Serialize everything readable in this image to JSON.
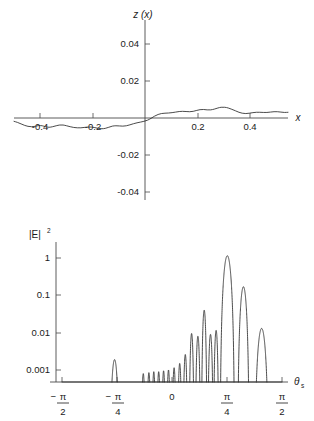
{
  "figure": {
    "background": "#ffffff",
    "line_color": "#2b2b2b",
    "axis_color": "#4a4a4a"
  },
  "chart_data": [
    {
      "id": "surface-profile",
      "type": "line",
      "title": "",
      "ylabel": "z (x)",
      "xlabel": "x",
      "xlim": [
        -0.5,
        0.5
      ],
      "ylim": [
        -0.05,
        0.05
      ],
      "grid": false,
      "legend": null,
      "xticks": [
        -0.4,
        -0.2,
        0.2,
        0.4
      ],
      "xticklabels": [
        "-0.4",
        "-0.2",
        "0.2",
        "0.4"
      ],
      "yticks": [
        -0.04,
        -0.02,
        0.02,
        0.04
      ],
      "yticklabels": [
        "-0.04",
        "-0.02",
        "0.02",
        "0.04"
      ],
      "yscale": "linear",
      "series": [
        {
          "name": "z(x)",
          "x": [
            -0.5,
            -0.487,
            -0.474,
            -0.461,
            -0.449,
            -0.436,
            -0.423,
            -0.41,
            -0.397,
            -0.385,
            -0.372,
            -0.359,
            -0.346,
            -0.333,
            -0.321,
            -0.308,
            -0.295,
            -0.282,
            -0.269,
            -0.256,
            -0.244,
            -0.231,
            -0.218,
            -0.205,
            -0.192,
            -0.179,
            -0.167,
            -0.154,
            -0.141,
            -0.128,
            -0.115,
            -0.103,
            -0.09,
            -0.077,
            -0.064,
            -0.051,
            -0.038,
            -0.026,
            -0.013,
            0.0,
            0.013,
            0.026,
            0.038,
            0.051,
            0.064,
            0.077,
            0.09,
            0.103,
            0.115,
            0.128,
            0.141,
            0.154,
            0.167,
            0.179,
            0.192,
            0.205,
            0.218,
            0.231,
            0.244,
            0.256,
            0.269,
            0.282,
            0.295,
            0.308,
            0.321,
            0.333,
            0.346,
            0.359,
            0.372,
            0.385,
            0.397,
            0.41,
            0.423,
            0.436,
            0.449,
            0.461,
            0.474,
            0.487,
            0.5
          ],
          "y": [
            -0.0018,
            -0.0024,
            -0.0032,
            -0.004,
            -0.0045,
            -0.0047,
            -0.0045,
            -0.0041,
            -0.0042,
            -0.0047,
            -0.005,
            -0.0047,
            -0.0042,
            -0.0038,
            -0.0038,
            -0.0042,
            -0.0047,
            -0.0051,
            -0.0053,
            -0.0053,
            -0.0051,
            -0.0049,
            -0.0049,
            -0.0052,
            -0.0056,
            -0.0058,
            -0.0056,
            -0.005,
            -0.0044,
            -0.0042,
            -0.0043,
            -0.0044,
            -0.0042,
            -0.0037,
            -0.0031,
            -0.0026,
            -0.0022,
            -0.0018,
            -0.0012,
            -0.0002,
            0.001,
            0.0019,
            0.0024,
            0.0026,
            0.0027,
            0.0029,
            0.0032,
            0.0035,
            0.0036,
            0.0035,
            0.0034,
            0.0036,
            0.0041,
            0.0045,
            0.0046,
            0.0044,
            0.0044,
            0.0048,
            0.0054,
            0.0058,
            0.0058,
            0.0054,
            0.0047,
            0.0039,
            0.0031,
            0.0026,
            0.0024,
            0.0026,
            0.0029,
            0.0031,
            0.0031,
            0.003,
            0.003,
            0.0032,
            0.0034,
            0.0034,
            0.0032,
            0.003,
            0.0031
          ]
        }
      ]
    },
    {
      "id": "scattered-intensity",
      "type": "line",
      "title": "",
      "ylabel": "|E|^2",
      "xlabel": "theta_s",
      "xlim": [
        -1.5708,
        1.5708
      ],
      "ylim": [
        0.0002,
        2.0
      ],
      "yscale": "log",
      "grid": false,
      "legend": null,
      "xticks": [
        -1.5708,
        -0.7854,
        0,
        0.7854,
        1.5708
      ],
      "xticklabels": [
        "-pi/2",
        "-pi/4",
        "0",
        "pi/4",
        "pi/2"
      ],
      "yticks": [
        0.001,
        0.01,
        0.1,
        1
      ],
      "yticklabels": [
        "0.001",
        "0.01",
        "0.1",
        "1"
      ],
      "description": "Diffraction-like lobe pattern; main lobe peaks slightly above 1 near theta_s = pi/4.",
      "lobes": [
        {
          "center": -1.29,
          "half_width": 0.075,
          "peak": 0.0004
        },
        {
          "center": -1.13,
          "half_width": 0.07,
          "peak": 0.00032
        },
        {
          "center": -0.95,
          "half_width": 0.06,
          "peak": 0.00034
        },
        {
          "center": -0.82,
          "half_width": 0.075,
          "peak": 0.0019
        },
        {
          "center": -0.68,
          "half_width": 0.055,
          "peak": 0.00048
        },
        {
          "center": -0.57,
          "half_width": 0.04,
          "peak": 0.0003
        },
        {
          "center": -0.49,
          "half_width": 0.038,
          "peak": 0.0004
        },
        {
          "center": -0.41,
          "half_width": 0.035,
          "peak": 0.0008
        },
        {
          "center": -0.33,
          "half_width": 0.034,
          "peak": 0.00085
        },
        {
          "center": -0.26,
          "half_width": 0.032,
          "peak": 0.0009
        },
        {
          "center": -0.19,
          "half_width": 0.032,
          "peak": 0.0009
        },
        {
          "center": -0.12,
          "half_width": 0.032,
          "peak": 0.00095
        },
        {
          "center": -0.05,
          "half_width": 0.032,
          "peak": 0.001
        },
        {
          "center": 0.03,
          "half_width": 0.033,
          "peak": 0.00115
        },
        {
          "center": 0.11,
          "half_width": 0.034,
          "peak": 0.0015
        },
        {
          "center": 0.19,
          "half_width": 0.036,
          "peak": 0.0026
        },
        {
          "center": 0.28,
          "half_width": 0.038,
          "peak": 0.0095
        },
        {
          "center": 0.37,
          "half_width": 0.04,
          "peak": 0.008
        },
        {
          "center": 0.46,
          "half_width": 0.042,
          "peak": 0.04
        },
        {
          "center": 0.55,
          "half_width": 0.042,
          "peak": 0.009
        },
        {
          "center": 0.63,
          "half_width": 0.04,
          "peak": 0.0115
        },
        {
          "center": 0.79,
          "half_width": 0.105,
          "peak": 1.15
        },
        {
          "center": 1.02,
          "half_width": 0.085,
          "peak": 0.17
        },
        {
          "center": 1.28,
          "half_width": 0.105,
          "peak": 0.013
        }
      ]
    }
  ],
  "labels": {
    "top": {
      "y_axis_title": "z (x)",
      "x_axis_title": "x",
      "yticks": [
        "0.04",
        "0.02",
        "-0.02",
        "-0.04"
      ],
      "xticks": [
        "-0.4",
        "-0.2",
        "0.2",
        "0.4"
      ]
    },
    "bottom": {
      "y_axis_title_base": "|E|",
      "y_axis_title_exp": "2",
      "x_axis_title_base": "θ",
      "x_axis_title_sub": "s",
      "yticks": [
        "1",
        "0.1",
        "0.01",
        "0.001"
      ],
      "xticks": [
        {
          "sign": "−",
          "num": "π",
          "den": "2"
        },
        {
          "sign": "−",
          "num": "π",
          "den": "4"
        },
        {
          "sign": "",
          "num": "0",
          "den": ""
        },
        {
          "sign": "",
          "num": "π",
          "den": "4"
        },
        {
          "sign": "",
          "num": "π",
          "den": "2"
        }
      ]
    }
  }
}
